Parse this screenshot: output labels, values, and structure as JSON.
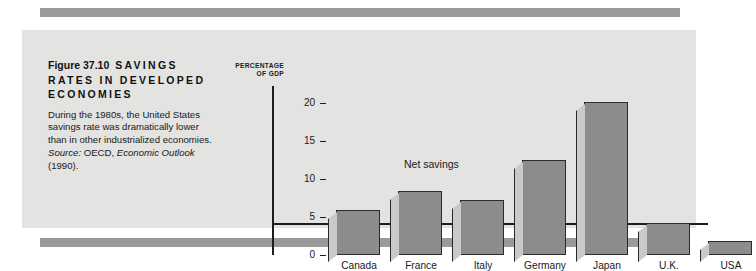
{
  "figure": {
    "number": "Figure 37.10",
    "title_caps": "SAVINGS RATES IN DEVELOPED ECONOMIES",
    "caption_body": "During the 1980s, the United States savings rate was dramatically lower than in other industrialized economies.",
    "source_label": "Source:",
    "source_publisher": "OECD,",
    "source_work": "Economic Outlook",
    "source_year": "(1990)."
  },
  "colors": {
    "panel_background": "#e3e3e1",
    "rule": "#9a9a9a",
    "bar_face": "#8c8c8c",
    "bar_bevel": "#c9c9c7",
    "bar_outline": "#2b2b2b",
    "axis": "#1d1d1d",
    "text": "#1a1a1a"
  },
  "chart_data": {
    "type": "bar",
    "title": "SAVINGS RATES IN DEVELOPED ECONOMIES",
    "categories": [
      "Canada",
      "France",
      "Italy",
      "Germany",
      "Japan",
      "U.K.",
      "USA"
    ],
    "values": [
      6.0,
      8.4,
      7.3,
      12.5,
      20.2,
      4.2,
      1.9
    ],
    "series": [
      {
        "name": "Net savings",
        "values": [
          6.0,
          8.4,
          7.3,
          12.5,
          20.2,
          4.2,
          1.9
        ]
      }
    ],
    "xlabel": "",
    "ylabel": "PERCENTAGE OF GDP",
    "ylabel_line1": "PERCENTAGE",
    "ylabel_line2": "OF GDP",
    "ylim": [
      0,
      21.5
    ],
    "yticks": [
      0,
      5,
      10,
      15,
      20
    ],
    "ytick_labels": [
      "0",
      "5",
      "10",
      "15",
      "20"
    ],
    "annotations": [
      {
        "text": "Net savings",
        "x": 2.0,
        "y": 12.8
      }
    ],
    "grid": false,
    "legend": "none"
  }
}
